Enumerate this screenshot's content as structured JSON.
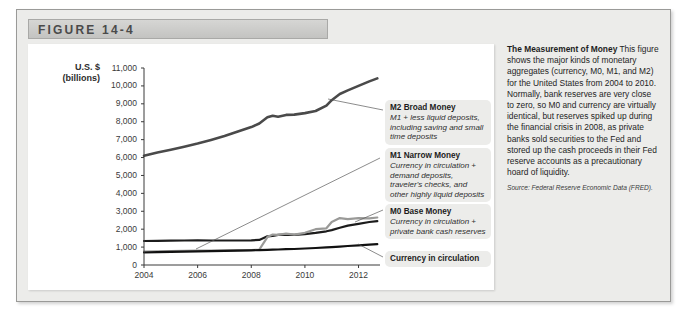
{
  "figure": {
    "header_label": "FIGURE 14-4"
  },
  "chart_data": {
    "type": "line",
    "title": "",
    "xlabel": "",
    "ylabel": "U.S. $ (billions)",
    "ylabel_line1": "U.S. $",
    "ylabel_line2": "(billions)",
    "ylim": [
      0,
      11000
    ],
    "xlim": [
      2004,
      2012.8
    ],
    "grid": false,
    "legend_position": "right-callouts",
    "yticks": [
      "0",
      "1,000",
      "2,000",
      "3,000",
      "4,000",
      "5,000",
      "6,000",
      "7,000",
      "8,000",
      "9,000",
      "10,000",
      "11,000"
    ],
    "ytick_values": [
      0,
      1000,
      2000,
      3000,
      4000,
      5000,
      6000,
      7000,
      8000,
      9000,
      10000,
      11000
    ],
    "xticks": [
      "2004",
      "2006",
      "2008",
      "2010",
      "2012"
    ],
    "xtick_values": [
      2004,
      2006,
      2008,
      2010,
      2012
    ],
    "x": [
      2004.0,
      2004.5,
      2005.0,
      2005.5,
      2006.0,
      2006.5,
      2007.0,
      2007.5,
      2008.0,
      2008.3,
      2008.6,
      2008.8,
      2009.0,
      2009.3,
      2009.6,
      2010.0,
      2010.4,
      2010.8,
      2011.0,
      2011.3,
      2011.6,
      2012.0,
      2012.4,
      2012.7
    ],
    "series": [
      {
        "name": "M2 Broad Money",
        "color": "#4a4a4a",
        "width": 2.6,
        "values": [
          6100,
          6280,
          6430,
          6600,
          6780,
          6980,
          7200,
          7450,
          7700,
          7900,
          8250,
          8330,
          8280,
          8380,
          8400,
          8480,
          8600,
          8900,
          9200,
          9550,
          9750,
          10000,
          10250,
          10420
        ]
      },
      {
        "name": "M1 Narrow Money",
        "color": "#1c1c1c",
        "width": 2.2,
        "values": [
          1340,
          1350,
          1360,
          1370,
          1380,
          1370,
          1370,
          1370,
          1380,
          1400,
          1600,
          1620,
          1680,
          1700,
          1680,
          1720,
          1790,
          1880,
          1950,
          2080,
          2200,
          2300,
          2400,
          2450
        ]
      },
      {
        "name": "M0 Base Money",
        "color": "#9a9a98",
        "width": 2.2,
        "values": [
          740,
          760,
          780,
          790,
          800,
          810,
          820,
          830,
          840,
          860,
          1560,
          1700,
          1680,
          1750,
          1700,
          1800,
          2000,
          2050,
          2400,
          2620,
          2560,
          2620,
          2600,
          2650
        ]
      },
      {
        "name": "Currency in circulation",
        "color": "#111111",
        "width": 2.2,
        "values": [
          700,
          715,
          730,
          745,
          760,
          775,
          790,
          805,
          820,
          830,
          845,
          855,
          865,
          880,
          895,
          920,
          950,
          980,
          1000,
          1030,
          1060,
          1100,
          1135,
          1160
        ]
      }
    ],
    "callouts": [
      {
        "title": "M2 Broad Money",
        "desc": "M1 + less liquid deposits, including saving and small time deposits"
      },
      {
        "title": "M1 Narrow Money",
        "desc": "Currency in circulation + demand deposits, traveler's checks, and other highly liquid deposits"
      },
      {
        "title": "M0 Base Money",
        "desc": "Currency in circulation + private bank cash reserves"
      },
      {
        "title": "Currency in circulation",
        "desc": ""
      }
    ]
  },
  "caption": {
    "lead": "The Measurement of Money",
    "body": " This figure shows the major kinds of monetary aggregates (currency, M0, M1, and M2) for the United States from 2004 to 2010. Normally, bank reserves are very close to zero, so M0 and currency are virtually identical, but reserves spiked up during the financial crisis in 2008, as private banks sold securities to the Fed and stored up the cash proceeds in their Fed reserve accounts as a precautionary hoard of liquidity.",
    "source": "Source: Federal Reserve Economic Data (FRED)."
  }
}
